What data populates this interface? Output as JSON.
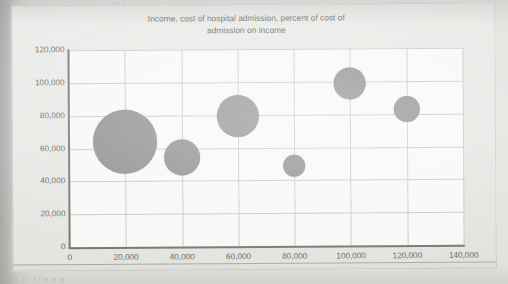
{
  "page": {
    "top_fragment": "...",
    "bottom_fragment": "m n i i i i n  n n"
  },
  "chart_data": {
    "type": "scatter",
    "variant": "bubble",
    "title": "Income, cost of hospital admission, percent of cost of admission on income",
    "title_line1": "Income, cost of hospital admission, percent of cost of",
    "title_line2": "admission on income",
    "xlabel": "",
    "ylabel": "",
    "xlim": [
      0,
      140000
    ],
    "ylim": [
      0,
      120000
    ],
    "xticks": [
      0,
      20000,
      40000,
      60000,
      80000,
      100000,
      120000,
      140000
    ],
    "yticks": [
      0,
      20000,
      40000,
      60000,
      80000,
      100000,
      120000
    ],
    "xtick_labels": [
      "0",
      "20,000",
      "40,000",
      "60,000",
      "80,000",
      "100,000",
      "120,000",
      "140,000"
    ],
    "ytick_labels": [
      "0",
      "20,000",
      "40,000",
      "60,000",
      "80,000",
      "100,000",
      "120,000"
    ],
    "grid": true,
    "legend": "none",
    "series_name": "Income vs cost of hospital admission",
    "bubble_color": "#8f8f8d",
    "plot_background": "#f8f8f6",
    "grid_color": "#c9c9c6",
    "axis_color": "#777775",
    "points": [
      {
        "x": 20000,
        "y": 64000,
        "r_px": 32,
        "size_rank": 1
      },
      {
        "x": 40000,
        "y": 54000,
        "r_px": 18,
        "size_rank": 3
      },
      {
        "x": 60000,
        "y": 79000,
        "r_px": 21,
        "size_rank": 2
      },
      {
        "x": 80000,
        "y": 48500,
        "r_px": 11,
        "size_rank": 6
      },
      {
        "x": 100000,
        "y": 99000,
        "r_px": 16,
        "size_rank": 4
      },
      {
        "x": 120000,
        "y": 83000,
        "r_px": 13,
        "size_rank": 5
      }
    ]
  }
}
